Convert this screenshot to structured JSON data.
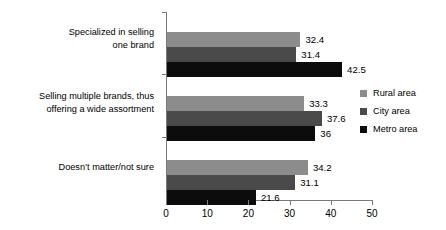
{
  "chart_data": {
    "type": "bar",
    "orientation": "horizontal",
    "title": "",
    "xlabel": "",
    "ylabel": "",
    "xlim": [
      0,
      50
    ],
    "xticks": [
      "0",
      "10",
      "20",
      "30",
      "40",
      "50"
    ],
    "grid": false,
    "legend_position": "right",
    "categories": [
      "Specialized in selling one brand",
      "Selling multiple brands, thus offering a wide assortment",
      "Doesn’t matter/not sure"
    ],
    "category_lines": [
      [
        "Specialized in selling",
        "one brand"
      ],
      [
        "Selling multiple brands, thus",
        "offering a wide assortment"
      ],
      [
        "Doesn’t matter/not sure"
      ]
    ],
    "series": [
      {
        "name": "Rural area",
        "color": "#8c8c8c",
        "values": [
          32.4,
          33.3,
          34.2
        ],
        "labels": [
          "32.4",
          "33.3",
          "34.2"
        ]
      },
      {
        "name": "City area",
        "color": "#4a4a4a",
        "values": [
          31.4,
          37.6,
          31.1
        ],
        "labels": [
          "31.4",
          "37.6",
          "31.1"
        ]
      },
      {
        "name": "Metro area",
        "color": "#0c0c0c",
        "values": [
          42.5,
          36.0,
          21.6
        ],
        "labels": [
          "42.5",
          "36",
          "21.6"
        ]
      }
    ]
  },
  "legend": {
    "items": [
      {
        "label": "Rural area",
        "color": "#8c8c8c"
      },
      {
        "label": "City area",
        "color": "#4a4a4a"
      },
      {
        "label": "Metro area",
        "color": "#0c0c0c"
      }
    ]
  }
}
